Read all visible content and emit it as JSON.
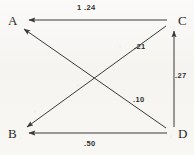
{
  "figure": {
    "type": "path-diagram",
    "nodes": [
      {
        "id": "A",
        "label": "A",
        "x": 16,
        "y": 22
      },
      {
        "id": "B",
        "label": "B",
        "x": 16,
        "y": 134
      },
      {
        "id": "C",
        "label": "C",
        "x": 176,
        "y": 22
      },
      {
        "id": "D",
        "label": "D",
        "x": 176,
        "y": 134
      }
    ],
    "edges": [
      {
        "id": "C-A",
        "from": "C",
        "to": "A",
        "label": "1 .24",
        "label_x": 77,
        "label_y": 5
      },
      {
        "id": "C-B",
        "from": "C",
        "to": "B",
        "label": ".21",
        "label_x": 134,
        "label_y": 44
      },
      {
        "id": "D-A",
        "from": "D",
        "to": "A",
        "label": ".10",
        "label_x": 133,
        "label_y": 97
      },
      {
        "id": "D-C",
        "from": "D",
        "to": "C",
        "label": ".27",
        "label_x": 175,
        "label_y": 73
      },
      {
        "id": "D-B",
        "from": "D",
        "to": "B",
        "label": ".50",
        "label_x": 84,
        "label_y": 141
      }
    ],
    "stroke_color": "#3a3a3a",
    "text_color": "#2b2b2b",
    "background_color": "#f7f6f3"
  }
}
